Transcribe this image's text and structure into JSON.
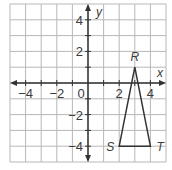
{
  "plane": {
    "x_axis_label": "x",
    "y_axis_label": "y",
    "x_ticks": [
      {
        "value": -4,
        "label": "−4"
      },
      {
        "value": -2,
        "label": "−2"
      },
      {
        "value": 0,
        "label": "0"
      },
      {
        "value": 2,
        "label": "2"
      },
      {
        "value": 4,
        "label": "4"
      }
    ],
    "y_ticks": [
      {
        "value": 4,
        "label": "4"
      },
      {
        "value": 2,
        "label": "2"
      },
      {
        "value": -2,
        "label": "−2"
      },
      {
        "value": -4,
        "label": "−4"
      }
    ],
    "range": {
      "xmin": -5,
      "xmax": 5,
      "ymin": -5,
      "ymax": 5
    },
    "grid_color": "#b8b8b8",
    "axis_color": "#333333"
  },
  "triangle": {
    "name": "RST",
    "stroke": "#333333",
    "vertices": [
      {
        "label": "R",
        "x": 3,
        "y": 1
      },
      {
        "label": "S",
        "x": 2,
        "y": -4
      },
      {
        "label": "T",
        "x": 4,
        "y": -4
      }
    ]
  }
}
